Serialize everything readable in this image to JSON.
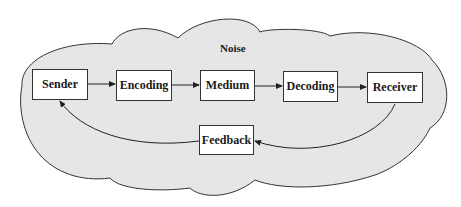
{
  "diagram": {
    "noise_label": "Noise",
    "nodes": [
      {
        "id": "sender",
        "label": "Sender"
      },
      {
        "id": "encoding",
        "label": "Encoding"
      },
      {
        "id": "medium",
        "label": "Medium"
      },
      {
        "id": "decoding",
        "label": "Decoding"
      },
      {
        "id": "receiver",
        "label": "Receiver"
      },
      {
        "id": "feedback",
        "label": "Feedback"
      }
    ],
    "edges": [
      {
        "from": "sender",
        "to": "encoding"
      },
      {
        "from": "encoding",
        "to": "medium"
      },
      {
        "from": "medium",
        "to": "decoding"
      },
      {
        "from": "decoding",
        "to": "receiver"
      },
      {
        "from": "receiver",
        "to": "feedback"
      },
      {
        "from": "feedback",
        "to": "sender"
      }
    ],
    "colors": {
      "cloud_fill": "#e6e6e6",
      "stroke": "#333333",
      "box_fill": "#ffffff"
    }
  }
}
